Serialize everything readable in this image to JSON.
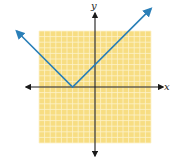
{
  "chart_data": {
    "type": "line",
    "title": "",
    "function": "y = |x + 4|",
    "xlabel": "x",
    "ylabel": "y",
    "xlim": [
      -10,
      10
    ],
    "ylim": [
      -10,
      10
    ],
    "grid": true,
    "grid_step": 1,
    "legend": null,
    "series": [
      {
        "name": "y = |x + 4|",
        "color": "#2a7fb8",
        "x": [
          -14,
          -4,
          10
        ],
        "y": [
          10,
          0,
          14
        ],
        "vertex": [
          -4,
          0
        ],
        "arrows_on_ends": true
      }
    ]
  },
  "axes": {
    "x_label": "x",
    "y_label": "y"
  },
  "colors": {
    "grid_background": "#f7dd82",
    "grid_lines": "#fdf3cc",
    "axis": "#1a1a1a",
    "curve": "#2a7fb8"
  }
}
